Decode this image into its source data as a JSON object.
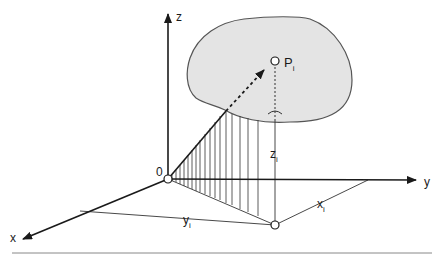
{
  "diagram": {
    "type": "3d-coordinate-projection",
    "axes": {
      "x_label": "x",
      "y_label": "y",
      "z_label": "z",
      "origin_label": "0"
    },
    "point": {
      "label": "P",
      "subscript": "i"
    },
    "dimensions": {
      "x_label": "x",
      "x_sub": "i",
      "y_label": "y",
      "y_sub": "i",
      "z_label": "z",
      "z_sub": "i"
    },
    "colors": {
      "line": "#1a1a1a",
      "thin_line": "#333333",
      "surface_fill": "#e4e4e4",
      "surface_stroke": "#555555",
      "rule": "#888888"
    }
  }
}
